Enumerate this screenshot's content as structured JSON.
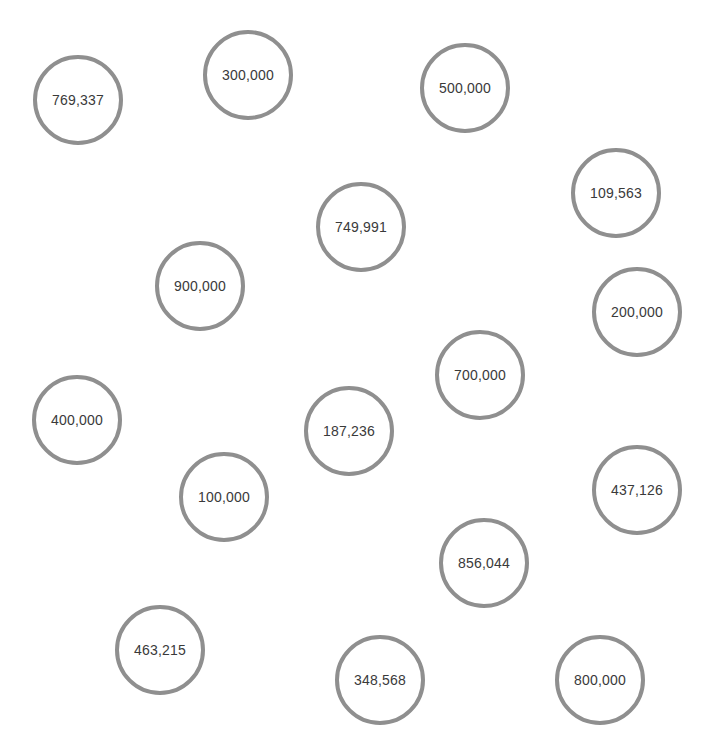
{
  "bubbles": [
    {
      "label": "769,337",
      "x": 78,
      "y": 100
    },
    {
      "label": "300,000",
      "x": 248,
      "y": 75
    },
    {
      "label": "500,000",
      "x": 465,
      "y": 88
    },
    {
      "label": "109,563",
      "x": 616,
      "y": 193
    },
    {
      "label": "749,991",
      "x": 361,
      "y": 227
    },
    {
      "label": "900,000",
      "x": 200,
      "y": 286
    },
    {
      "label": "200,000",
      "x": 637,
      "y": 312
    },
    {
      "label": "700,000",
      "x": 480,
      "y": 375
    },
    {
      "label": "400,000",
      "x": 77,
      "y": 420
    },
    {
      "label": "187,236",
      "x": 349,
      "y": 431
    },
    {
      "label": "100,000",
      "x": 224,
      "y": 497
    },
    {
      "label": "437,126",
      "x": 637,
      "y": 490
    },
    {
      "label": "856,044",
      "x": 484,
      "y": 563
    },
    {
      "label": "463,215",
      "x": 160,
      "y": 650
    },
    {
      "label": "348,568",
      "x": 380,
      "y": 680
    },
    {
      "label": "800,000",
      "x": 600,
      "y": 680
    }
  ],
  "colors": {
    "background": "#ffffff",
    "circle_border": "#8f8f8f",
    "text": "#3a3a3a"
  }
}
